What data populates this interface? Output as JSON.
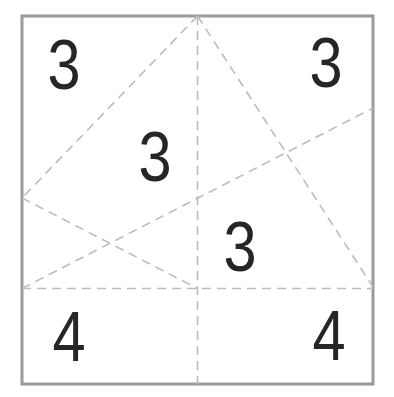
{
  "figure": {
    "background_color": "#ffffff",
    "border_color": "#9a9a9a",
    "border_width": 3,
    "crease_color": "#bcbcbc",
    "crease_width": 1.6,
    "crease_dash": "9 6",
    "label_color": "#262626",
    "label_font_size": 70,
    "label_x_scale": 0.85,
    "square": {
      "x": 22,
      "y": 16,
      "width": 351,
      "height": 368
    },
    "creases": [
      {
        "name": "crease-vertical-midline",
        "x1": 197.5,
        "y1": 16,
        "x2": 197.5,
        "y2": 384
      },
      {
        "name": "crease-horizontal-lower-line",
        "x1": 22,
        "y1": 288.5,
        "x2": 373,
        "y2": 288.5
      },
      {
        "name": "crease-topmid-to-leftmid",
        "x1": 197.5,
        "y1": 16,
        "x2": 22,
        "y2": 198
      },
      {
        "name": "crease-leftmid-to-bottommid",
        "x1": 22,
        "y1": 198,
        "x2": 197.5,
        "y2": 288.5
      },
      {
        "name": "crease-topmid-to-right-lower",
        "x1": 197.5,
        "y1": 16,
        "x2": 373,
        "y2": 287
      },
      {
        "name": "crease-left-lower-to-right-upper",
        "x1": 22,
        "y1": 288.5,
        "x2": 373,
        "y2": 108
      }
    ],
    "labels": [
      {
        "name": "region-label-top-left",
        "text": "3",
        "x": 64,
        "y": 64
      },
      {
        "name": "region-label-top-right",
        "text": "3",
        "x": 326,
        "y": 62
      },
      {
        "name": "region-label-center",
        "text": "3",
        "x": 155,
        "y": 156
      },
      {
        "name": "region-label-mid-right",
        "text": "3",
        "x": 240,
        "y": 246
      },
      {
        "name": "region-label-bottom-left",
        "text": "4",
        "x": 69,
        "y": 336
      },
      {
        "name": "region-label-bottom-right",
        "text": "4",
        "x": 329,
        "y": 335
      }
    ]
  }
}
